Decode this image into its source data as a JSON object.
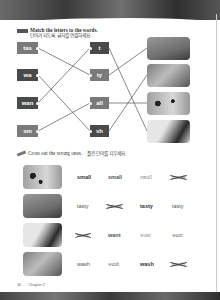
{
  "section1": {
    "tag_icon": "pencil-tag-icon",
    "title_en": "Match the letters to the words.",
    "title_ko": "단어가 되도록 글자를 연결하세요.",
    "left_boxes": [
      {
        "text": "tas",
        "color": "#7a7a7a"
      },
      {
        "text": "wa",
        "color": "#4a4a4a"
      },
      {
        "text": "wan",
        "color": "#4a4a4a"
      },
      {
        "text": "sm",
        "color": "#7a7a7a"
      }
    ],
    "middle_boxes": [
      {
        "text": "t",
        "color": "#4a4a4a"
      },
      {
        "text": "ty",
        "color": "#7a7a7a"
      },
      {
        "text": "all",
        "color": "#7a7a7a"
      },
      {
        "text": "sh",
        "color": "#4a4a4a"
      }
    ],
    "pictures": [
      "dog-with-flag-picture",
      "dog-eating-picture",
      "dalmatians-picture",
      "cat-washing-picture"
    ],
    "connections_left": [
      [
        0,
        1
      ],
      [
        1,
        3
      ],
      [
        2,
        0
      ],
      [
        3,
        2
      ]
    ],
    "connections_right": [
      [
        0,
        3
      ],
      [
        1,
        0
      ],
      [
        2,
        2
      ],
      [
        3,
        1
      ]
    ]
  },
  "section2": {
    "icon": "pencil-icon",
    "title_en": "Cross out the wrong ones.",
    "title_ko": "틀린 단어를 지우세요.",
    "pictures": [
      "dalmatians-picture",
      "dog-eating-picture",
      "cat-washing-picture",
      "dog-with-flag-picture"
    ],
    "rows": [
      {
        "words": [
          "small",
          "small",
          "small",
          "maall"
        ],
        "crossed": [
          false,
          false,
          false,
          true
        ]
      },
      {
        "words": [
          "tasty",
          "takes",
          "tasty",
          "tasty"
        ],
        "crossed": [
          false,
          true,
          false,
          false
        ]
      },
      {
        "words": [
          "want",
          "want",
          "want",
          "want"
        ],
        "crossed": [
          true,
          false,
          false,
          false
        ]
      },
      {
        "words": [
          "wash",
          "wash",
          "wash",
          "wash"
        ],
        "crossed": [
          false,
          false,
          false,
          true
        ]
      }
    ]
  },
  "footer": {
    "page_number": "30",
    "chapter": "Chapter 2"
  }
}
